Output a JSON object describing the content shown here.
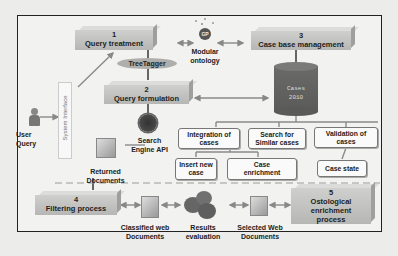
{
  "diagram": {
    "steps": [
      {
        "number": "1",
        "label": "Query treatment"
      },
      {
        "number": "2",
        "label": "Query formulation"
      },
      {
        "number": "3",
        "label": "Case base management"
      },
      {
        "number": "4",
        "label": "Filtering process"
      },
      {
        "number": "5",
        "label": "Ontological enrichment process"
      }
    ],
    "step5_lines": [
      "Ostological",
      "enrichment",
      "process"
    ],
    "tool": "TreeTagger",
    "ontology": {
      "badge": "GP",
      "label_line1": "Modular",
      "label_line2": "ontology"
    },
    "database": {
      "line1": "Cases",
      "line2": "2010"
    },
    "user": {
      "line1": "User",
      "line2": "Query"
    },
    "system_interface": "System Interface",
    "search_engine": {
      "line1": "Search",
      "line2": "Engine API"
    },
    "returned_docs": {
      "line1": "Returned",
      "line2": "Documents"
    },
    "case_ops": {
      "integration": {
        "line1": "Integration of",
        "line2": "cases"
      },
      "search": {
        "line1": "Search for",
        "line2": "Similar cases"
      },
      "validation": {
        "line1": "Validation of",
        "line2": "cases"
      },
      "insert": {
        "line1": "Insert new",
        "line2": "case"
      },
      "enrichment": {
        "line1": "Case",
        "line2": "enrichment"
      },
      "state": "Case state"
    },
    "classified_docs": {
      "line1": "Classified web",
      "line2": "Documents"
    },
    "results_eval": {
      "line1": "Results",
      "line2": "evaluation"
    },
    "selected_docs": {
      "line1": "Selected Web",
      "line2": "Documents"
    }
  }
}
